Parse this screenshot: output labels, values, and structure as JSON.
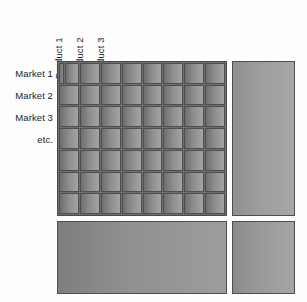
{
  "diagram": {
    "background_color": "#fdfdfd",
    "cell_color": "#8c8c8c",
    "border_color": "#4e4e4e",
    "label_color": "#1c1c1c"
  },
  "column_labels": [
    {
      "text": "Product 1"
    },
    {
      "text": "Product 2"
    },
    {
      "text": "Product 3"
    },
    {
      "text": "etc."
    }
  ],
  "row_labels": [
    {
      "text": "Market 1"
    },
    {
      "text": "Market 2"
    },
    {
      "text": "Market 3"
    },
    {
      "text": "etc."
    }
  ],
  "grid": {
    "columns": 8,
    "rows": 7,
    "has_leading_sliver_cell": true
  },
  "panels": {
    "side": {
      "name": "right-side-panel"
    },
    "bottom_main": {
      "name": "bottom-main-panel"
    },
    "bottom_side": {
      "name": "bottom-side-panel"
    }
  }
}
